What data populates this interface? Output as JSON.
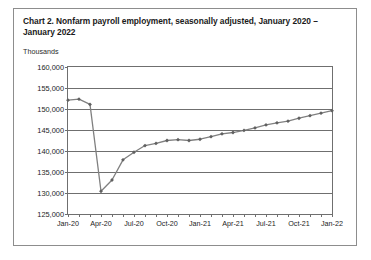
{
  "figure": {
    "title": "Chart 2. Nonfarm payroll employment, seasonally adjusted,\nJanuary 2020 – January 2022",
    "units_label": "Thousands"
  },
  "chart_data": {
    "type": "line",
    "title": "Chart 2. Nonfarm payroll employment, seasonally adjusted, January 2020 – January 2022",
    "xlabel": "",
    "ylabel": "Thousands",
    "ylim": [
      125000,
      160000
    ],
    "ytick_values": [
      125000,
      130000,
      135000,
      140000,
      145000,
      150000,
      155000,
      160000
    ],
    "ytick_labels": [
      "125,000",
      "130,000",
      "135,000",
      "140,000",
      "145,000",
      "150,000",
      "155,000",
      "160,000"
    ],
    "grid": true,
    "legend": false,
    "line_color": "#808080",
    "marker": "diamond",
    "marker_color": "#606060",
    "x": [
      "Jan-20",
      "Feb-20",
      "Mar-20",
      "Apr-20",
      "May-20",
      "Jun-20",
      "Jul-20",
      "Aug-20",
      "Sep-20",
      "Oct-20",
      "Nov-20",
      "Dec-20",
      "Jan-21",
      "Feb-21",
      "Mar-21",
      "Apr-21",
      "May-21",
      "Jun-21",
      "Jul-21",
      "Aug-21",
      "Sep-21",
      "Oct-21",
      "Nov-21",
      "Dec-21",
      "Jan-22"
    ],
    "xtick_labels": [
      "Jan-20",
      "Apr-20",
      "Jul-20",
      "Oct-20",
      "Jan-21",
      "Apr-21",
      "Jul-21",
      "Oct-21",
      "Jan-22"
    ],
    "values": [
      152090,
      152350,
      151090,
      130420,
      133100,
      137900,
      139700,
      141300,
      141800,
      142500,
      142700,
      142500,
      142800,
      143400,
      144100,
      144400,
      144900,
      145500,
      146200,
      146700,
      147100,
      147800,
      148400,
      149000,
      149600
    ]
  }
}
